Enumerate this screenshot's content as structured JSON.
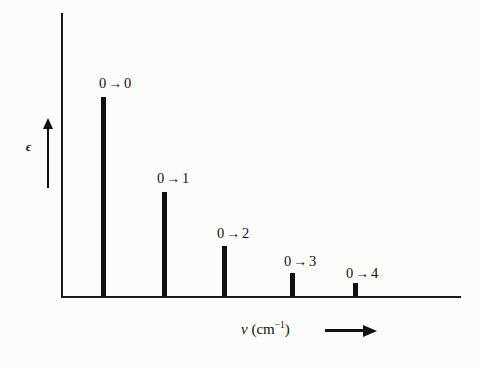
{
  "figure": {
    "background_color": "#fcfcfb",
    "ink_color": "#111111",
    "width": 480,
    "height": 368
  },
  "axes": {
    "y_axis_label": "ϵ",
    "y_axis_arrow": "up-arrow",
    "x_axis_label_symbol": "ν",
    "x_axis_label_unit_open": " (cm",
    "x_axis_label_unit_exp": "−1",
    "x_axis_label_unit_close": ")",
    "x_axis_label_full": "ν (cm⁻¹)",
    "x_axis_arrow": "right-arrow",
    "x_origin_px": 61,
    "x_end_px": 461,
    "y_top_px": 13,
    "baseline_px": 296
  },
  "chart_data": {
    "type": "bar",
    "title": "",
    "subtitle": "",
    "xlabel": "ν (cm⁻¹)",
    "ylabel": "ϵ",
    "grid": false,
    "legend": "none",
    "note": "Vibronic stick spectrum: Franck-Condon progression of 0→v' transitions with decreasing intensity.",
    "categories": [
      "0 → 0",
      "0 → 1",
      "0 → 2",
      "0 → 3",
      "0 → 4"
    ],
    "values": [
      199,
      104,
      50,
      23,
      13
    ],
    "ylim": [
      0,
      283
    ],
    "xlim": [
      0,
      400
    ],
    "bars": [
      {
        "label": "0 → 0",
        "from_level": "0",
        "to_level": "0",
        "x_px": 101,
        "top_px": 97,
        "height_px": 199,
        "width_px": 5,
        "label_x_px": 99,
        "label_y_px": 76
      },
      {
        "label": "0 → 1",
        "from_level": "0",
        "to_level": "1",
        "x_px": 162,
        "top_px": 192,
        "height_px": 104,
        "width_px": 5,
        "label_x_px": 157,
        "label_y_px": 171
      },
      {
        "label": "0 → 2",
        "from_level": "0",
        "to_level": "2",
        "x_px": 222,
        "top_px": 246,
        "height_px": 50,
        "width_px": 5,
        "label_x_px": 217,
        "label_y_px": 226
      },
      {
        "label": "0 → 3",
        "from_level": "0",
        "to_level": "3",
        "x_px": 290,
        "top_px": 273,
        "height_px": 23,
        "width_px": 5,
        "label_x_px": 284,
        "label_y_px": 254
      },
      {
        "label": "0 → 4",
        "from_level": "0",
        "to_level": "4",
        "x_px": 353,
        "top_px": 283,
        "height_px": 13,
        "width_px": 5,
        "label_x_px": 346,
        "label_y_px": 266
      }
    ]
  }
}
